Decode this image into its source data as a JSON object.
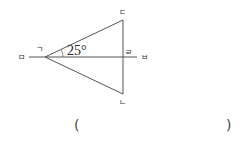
{
  "diagram": {
    "points": {
      "giyeok": {
        "label": "ㄱ",
        "x": 45,
        "y": 57
      },
      "digeut": {
        "label": "ㄷ",
        "x": 123,
        "y": 20
      },
      "nieun": {
        "label": "ㄴ",
        "x": 123,
        "y": 94
      },
      "rieul": {
        "label": "ㄹ",
        "x": 123,
        "y": 57
      },
      "mieum": {
        "label": "ㅁ"
      },
      "bieup": {
        "label": "ㅂ"
      }
    },
    "angle_label": "25°",
    "line_color": "#555555"
  },
  "answer": {
    "open_paren": "(",
    "close_paren": ")"
  }
}
